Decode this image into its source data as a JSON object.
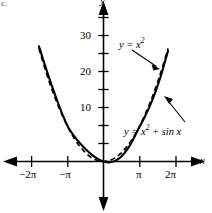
{
  "figure": {
    "panel_label": "c.",
    "axis_x_name": "x",
    "axis_y_name": "y",
    "background": "#ffffff",
    "ink": "#000000"
  },
  "labels": {
    "curve_dashed": {
      "text": "y = x",
      "exponent": "2",
      "suffix": ""
    },
    "curve_solid": {
      "text": "y = x",
      "exponent": "2",
      "suffix": " + sin x"
    },
    "curve_dashed_full": "y = x²",
    "curve_solid_full": "y = x² + sin x"
  },
  "chart_data": {
    "type": "line",
    "title": "",
    "xlabel": "x",
    "ylabel": "y",
    "xlim": [
      -8.5,
      8.5
    ],
    "ylim": [
      -4,
      38
    ],
    "grid": false,
    "legend": "annotated-inline",
    "xticks": [
      -6.283185,
      -3.141593,
      3.141593,
      6.283185
    ],
    "xticklabels": [
      "−2π",
      "−π",
      "π",
      "2π"
    ],
    "yticks": [
      5,
      10,
      15,
      20,
      25,
      30,
      35
    ],
    "yticklabels_shown": {
      "10": "10",
      "20": "20",
      "30": "30"
    },
    "series": [
      {
        "name": "y = x²",
        "style": "dashed",
        "formula": "x^2",
        "points": [
          {
            "x": -5.6,
            "y": 31.36
          },
          {
            "x": -5.0,
            "y": 25.0
          },
          {
            "x": -4.5,
            "y": 20.25
          },
          {
            "x": -4.0,
            "y": 16.0
          },
          {
            "x": -3.5,
            "y": 12.25
          },
          {
            "x": -3.0,
            "y": 9.0
          },
          {
            "x": -2.5,
            "y": 6.25
          },
          {
            "x": -2.0,
            "y": 4.0
          },
          {
            "x": -1.5,
            "y": 2.25
          },
          {
            "x": -1.0,
            "y": 1.0
          },
          {
            "x": -0.5,
            "y": 0.25
          },
          {
            "x": 0.0,
            "y": 0.0
          },
          {
            "x": 0.5,
            "y": 0.25
          },
          {
            "x": 1.0,
            "y": 1.0
          },
          {
            "x": 1.5,
            "y": 2.25
          },
          {
            "x": 2.0,
            "y": 4.0
          },
          {
            "x": 2.5,
            "y": 6.25
          },
          {
            "x": 3.0,
            "y": 9.0
          },
          {
            "x": 3.5,
            "y": 12.25
          },
          {
            "x": 4.0,
            "y": 16.0
          },
          {
            "x": 4.5,
            "y": 20.25
          },
          {
            "x": 5.0,
            "y": 25.0
          },
          {
            "x": 5.6,
            "y": 31.36
          }
        ]
      },
      {
        "name": "y = x² + sin x",
        "style": "solid",
        "formula": "x^2 + sin(x)",
        "points": [
          {
            "x": -5.6,
            "y": 31.99
          },
          {
            "x": -5.0,
            "y": 25.96
          },
          {
            "x": -4.5,
            "y": 21.23
          },
          {
            "x": -4.0,
            "y": 16.76
          },
          {
            "x": -3.5,
            "y": 12.6
          },
          {
            "x": -3.0,
            "y": 9.14
          },
          {
            "x": -2.5,
            "y": 6.85
          },
          {
            "x": -2.0,
            "y": 4.91
          },
          {
            "x": -1.5,
            "y": 3.25
          },
          {
            "x": -1.0,
            "y": 1.84
          },
          {
            "x": -0.5,
            "y": 0.73
          },
          {
            "x": 0.0,
            "y": 0.0
          },
          {
            "x": 0.5,
            "y": -0.23
          },
          {
            "x": 1.0,
            "y": 0.16
          },
          {
            "x": 1.5,
            "y": 1.25
          },
          {
            "x": 2.0,
            "y": 3.09
          },
          {
            "x": 2.5,
            "y": 5.65
          },
          {
            "x": 3.0,
            "y": 8.86
          },
          {
            "x": 3.5,
            "y": 11.9
          },
          {
            "x": 4.0,
            "y": 15.24
          },
          {
            "x": 4.5,
            "y": 19.27
          },
          {
            "x": 5.0,
            "y": 24.04
          },
          {
            "x": 5.6,
            "y": 30.73
          }
        ]
      }
    ],
    "annotations": [
      {
        "label": "y = x²",
        "points_to_series": "y = x²",
        "arrow": "down-right"
      },
      {
        "label": "y = x² + sin x",
        "points_to_series": "y = x² + sin x",
        "arrow": "up-left"
      }
    ]
  }
}
